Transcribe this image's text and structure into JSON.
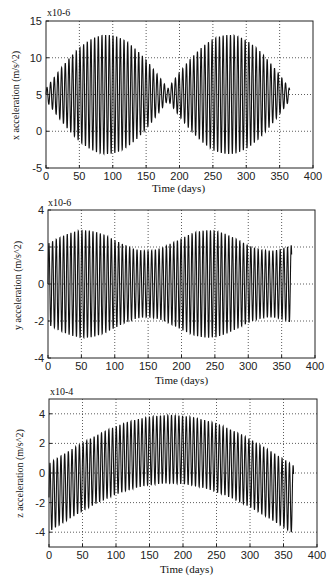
{
  "chart_data": [
    {
      "type": "line",
      "title": "",
      "xlabel": "Time (days)",
      "ylabel": "x acceleration (m/s^2)",
      "y_multiplier_label": "x10-6",
      "xlim": [
        0,
        400
      ],
      "ylim": [
        -5,
        15
      ],
      "xticks": [
        0,
        50,
        100,
        150,
        200,
        250,
        300,
        350,
        400
      ],
      "yticks": [
        -5,
        0,
        5,
        10,
        15
      ],
      "grid": true,
      "grid_x": [
        50,
        100,
        150,
        200,
        250,
        300,
        350
      ],
      "grid_y": [
        0,
        5,
        10
      ],
      "legend": null,
      "series": [
        {
          "name": "x acceleration",
          "x_range": [
            0,
            365
          ],
          "description": "Oscillation (~5.5 day period) about mean 5e-6, amplitude envelope peaks ~7.5e-6 near days 95 and 270, minimum ~1e-6 near days 0, 185 and 365",
          "mean": 5,
          "period_days": 5.5,
          "envelope": {
            "kind": "abs_sin",
            "base": 0.8,
            "amp": 7.3,
            "period": 176,
            "phase": 0
          },
          "peaks_sampled": [
            {
              "t": 0,
              "max": 6.3,
              "min": 4.5
            },
            {
              "t": 50,
              "max": 11.5,
              "min": -0.5
            },
            {
              "t": 95,
              "max": 13.5,
              "min": -1.8
            },
            {
              "t": 150,
              "max": 9,
              "min": 2
            },
            {
              "t": 185,
              "max": 6.5,
              "min": 4.3
            },
            {
              "t": 230,
              "max": 11,
              "min": 0
            },
            {
              "t": 270,
              "max": 13.5,
              "min": -1.8
            },
            {
              "t": 320,
              "max": 10,
              "min": 1.5
            },
            {
              "t": 365,
              "max": 6.8,
              "min": 4.5
            }
          ]
        }
      ]
    },
    {
      "type": "line",
      "title": "",
      "xlabel": "Time (days)",
      "ylabel": "y acceleration (m/s^2)",
      "y_multiplier_label": "x10-6",
      "xlim": [
        0,
        400
      ],
      "ylim": [
        -4,
        4
      ],
      "xticks": [
        0,
        50,
        100,
        150,
        200,
        250,
        300,
        350,
        400
      ],
      "yticks": [
        -4,
        -2,
        0,
        2,
        4
      ],
      "grid": true,
      "grid_x": [
        50,
        100,
        150,
        200,
        250,
        300,
        350
      ],
      "grid_y": [
        -2,
        0,
        2
      ],
      "legend": null,
      "series": [
        {
          "name": "y acceleration",
          "x_range": [
            0,
            365
          ],
          "description": "Oscillation (~5.5 day period) about 0, amplitude ~1.8-2.9e-6, larger near days 55 and 240, smaller near days 150 and 340",
          "mean": 0,
          "period_days": 5.5,
          "envelope": {
            "kind": "cos",
            "base": 2.35,
            "amp": 0.55,
            "period": 185,
            "phase": 55
          },
          "peaks_sampled": [
            {
              "t": 0,
              "max": 1.8,
              "min": -2.0
            },
            {
              "t": 55,
              "max": 2.9,
              "min": -3.0
            },
            {
              "t": 150,
              "max": 1.9,
              "min": -1.8
            },
            {
              "t": 240,
              "max": 2.9,
              "min": -3.0
            },
            {
              "t": 340,
              "max": 2.2,
              "min": -2.2
            },
            {
              "t": 365,
              "max": 1.0,
              "min": -1.8
            }
          ]
        }
      ]
    },
    {
      "type": "line",
      "title": "",
      "xlabel": "Time (days)",
      "ylabel": "z acceleration (m/s^2)",
      "y_multiplier_label": "x10-4",
      "xlim": [
        0,
        400
      ],
      "ylim": [
        -5,
        5
      ],
      "xticks": [
        0,
        50,
        100,
        150,
        200,
        250,
        300,
        350,
        400
      ],
      "yticks": [
        -4,
        -2,
        0,
        2,
        4
      ],
      "grid": true,
      "grid_x": [
        50,
        100,
        150,
        200,
        250,
        300,
        350
      ],
      "grid_y": [
        -4,
        -2,
        0,
        2,
        4
      ],
      "legend": null,
      "series": [
        {
          "name": "z acceleration",
          "x_range": [
            0,
            365
          ],
          "description": "Oscillation (~5.5 day period, amplitude ~2.3) riding on a slow arch: mean ~-1.8 at day 0, ~+1.6 at day 180, ~-1.6 at day 365",
          "mean_curve": {
            "kind": "cos_arch",
            "center": 180,
            "low": -1.8,
            "high": 1.6,
            "half_width": 185
          },
          "period_days": 5.5,
          "envelope": {
            "kind": "const",
            "base": 2.3
          },
          "peaks_sampled": [
            {
              "t": 0,
              "max": 0,
              "min": -4.0
            },
            {
              "t": 50,
              "max": 1.1,
              "min": -3.4
            },
            {
              "t": 100,
              "max": 2.8,
              "min": -2.0
            },
            {
              "t": 160,
              "max": 4.0,
              "min": -0.7
            },
            {
              "t": 195,
              "max": 3.9,
              "min": -0.7
            },
            {
              "t": 250,
              "max": 2.5,
              "min": -1.8
            },
            {
              "t": 300,
              "max": 1.2,
              "min": -3.0
            },
            {
              "t": 355,
              "max": 0.5,
              "min": -4.0
            }
          ]
        }
      ]
    }
  ],
  "panels": [
    {
      "top_label": "x10-6",
      "xlabel": "Time (days)",
      "ylabel": "x acceleration (m/s^2)"
    },
    {
      "top_label": "x10-6",
      "xlabel": "Time (days)",
      "ylabel": "y acceleration (m/s^2)"
    },
    {
      "top_label": "x10-4",
      "xlabel": "Time (days)",
      "ylabel": "z acceleration (m/s^2)"
    }
  ],
  "layout": [
    {
      "left": 46,
      "top": 21,
      "right": 313,
      "bottom": 168
    },
    {
      "left": 48,
      "top": 210,
      "right": 315,
      "bottom": 358
    },
    {
      "left": 49,
      "top": 399,
      "right": 317,
      "bottom": 547
    }
  ],
  "colors": {
    "line": "#111111",
    "grid": "#333333",
    "axes": "#222222",
    "background": "#ffffff"
  }
}
